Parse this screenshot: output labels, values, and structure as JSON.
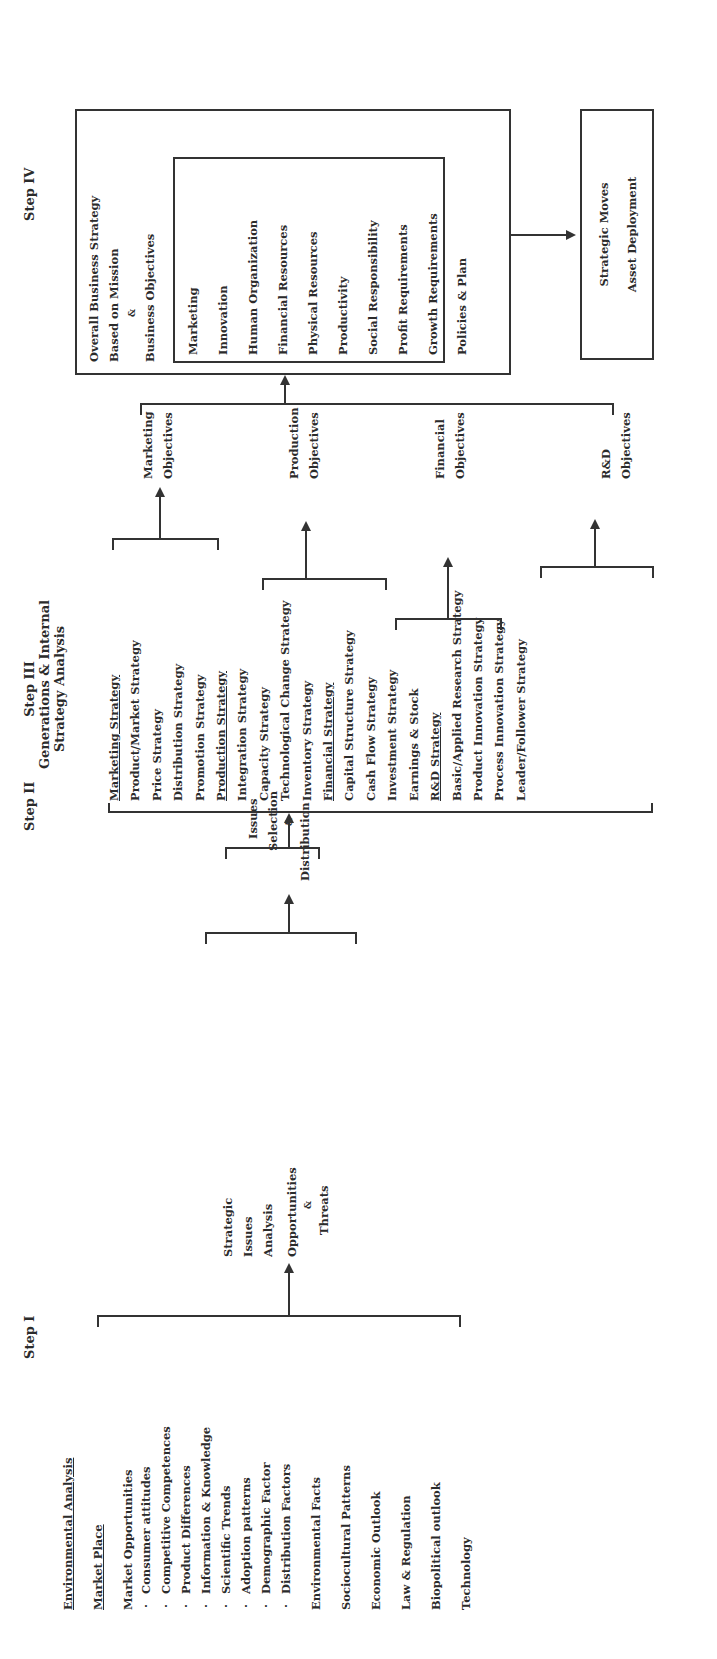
{
  "steps": {
    "step1": "Step I",
    "step2": "Step II",
    "step3_line1": "Step III",
    "step3_line2": "Generations & Internal",
    "step3_line3": "Strategy Analysis",
    "step4": "Step IV"
  },
  "environmental_analysis": {
    "heading": "Environmental Analysis",
    "market_place": "Market Place",
    "market_opportunities": "Market Opportunities",
    "sub_items": [
      "Consumer attitudes",
      "Competitive Competences",
      "Product Differences",
      "Information & Knowledge",
      "Scientific Trends",
      "Adoption patterns",
      "Demographic Factor",
      "Distribution Factors"
    ],
    "other_items": [
      "Environmental Facts",
      "Sociocultural Patterns",
      "Economic Outlook",
      "Law & Regulation",
      "Biopolitical outlook",
      "Technology"
    ]
  },
  "strategic_issues": {
    "lines": [
      "Strategic",
      "Issues",
      "Analysis",
      "Opportunities",
      "&",
      "Threats"
    ]
  },
  "issues_selection": {
    "lines": [
      "Issues",
      "Selection",
      "&",
      "Distribution"
    ]
  },
  "internal_strategy": {
    "marketing": {
      "heading": "Marketing Strategy",
      "items": [
        "Product/Market Strategy",
        "Price Strategy",
        "Distribution Strategy",
        "Promotion Strategy"
      ]
    },
    "production": {
      "heading": "Production Strategy",
      "items": [
        "Integration Strategy",
        "Capacity Strategy",
        "Technological Change Strategy",
        "Inventory Strategy"
      ]
    },
    "financial": {
      "heading": "Financial Strategy",
      "items": [
        "Capital Structure Strategy",
        "Cash Flow Strategy",
        "Investment Strategy",
        "Earnings & Stock"
      ]
    },
    "rnd": {
      "heading": "R&D Strategy",
      "items": [
        "Basic/Applied Research Strategy",
        "Product Innovation Strategy",
        "Process Innovation Strategy",
        "Leader/Follower Strategy"
      ]
    }
  },
  "objectives": {
    "marketing": [
      "Marketing",
      "Objectives"
    ],
    "production": [
      "Production",
      "Objectives"
    ],
    "financial": [
      "Financial",
      "Objectives"
    ],
    "rnd": [
      "R&D",
      "Objectives"
    ]
  },
  "business_strategy": {
    "title_line1": "Overall Business Strategy",
    "title_line2": "Based on Mission",
    "amp": "&",
    "objectives_heading": "Business Objectives",
    "objectives": [
      "Marketing",
      "Innovation",
      "Human Organization",
      "Financial Resources",
      "Physical Resources",
      "Productivity",
      "Social Responsibility",
      "Profit Requirements",
      "Growth Requirements"
    ],
    "policies": "Policies & Plan"
  },
  "strategic_moves": {
    "line1": "Strategic Moves",
    "line2": "Asset Deployment"
  }
}
